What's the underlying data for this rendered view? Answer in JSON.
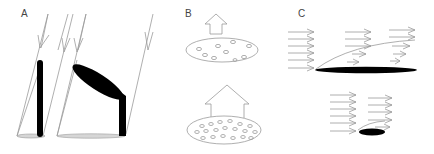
{
  "figure": {
    "width": 434,
    "height": 154,
    "colors": {
      "line": "#9a9a9a",
      "fill_dark": "#000000",
      "ellipse_fill": "#d6d6d6",
      "label": "#444444"
    }
  },
  "panels": [
    {
      "label": "A",
      "description": "Light rays incident on upright and tilted leaves casting shadows on ground",
      "elements": [
        "incoming-light-rays",
        "upright-stem-leaf",
        "tilted-elliptical-leaf",
        "ground-shadow-ellipses"
      ]
    },
    {
      "label": "B",
      "description": "Upward arrows above disks with few vs many stomata-like pores",
      "elements": [
        "small-up-arrow",
        "disk-sparse-pores",
        "large-up-arrow",
        "disk-dense-pores"
      ],
      "pore_counts": {
        "top_disk": 9,
        "bottom_disk": 19
      }
    },
    {
      "label": "C",
      "description": "Airflow arrows over long and short flat leaf with boundary layer curve",
      "elements": [
        "wind-arrows",
        "long-flat-leaf",
        "boundary-layer-curve",
        "short-flat-leaf"
      ]
    }
  ]
}
